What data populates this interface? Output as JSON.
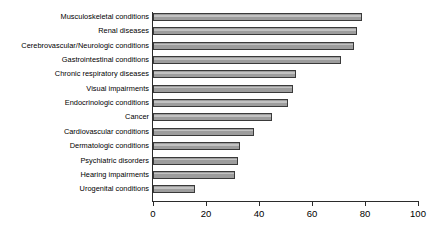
{
  "chart_data": {
    "type": "bar",
    "orientation": "horizontal",
    "title": "",
    "subtitle": "",
    "xlabel": "",
    "ylabel": "",
    "xlim": [
      0,
      100
    ],
    "xticks": [
      0,
      20,
      40,
      60,
      80,
      100
    ],
    "xtick_labels": [
      "0",
      "20",
      "40",
      "60",
      "80",
      "100"
    ],
    "grid": false,
    "legend": null,
    "legend_position": "none",
    "categories": [
      "Musculoskeletal conditions",
      "Renal diseases",
      "Cerebrovascular/Neurologic conditions",
      "Gastrointestinal conditions",
      "Chronic respiratory diseases",
      "Visual impairments",
      "Endocrinologic conditions",
      "Cancer",
      "Cardiovascular conditions",
      "Dermatologic conditions",
      "Psychiatric disorders",
      "Hearing impairments",
      "Urogenital conditions"
    ],
    "values": [
      79,
      77,
      76,
      71,
      54,
      53,
      51,
      45,
      38,
      33,
      32,
      31,
      16
    ],
    "bar_fill_color": "#9d9d9d",
    "bar_edge_color": "#3a3a3a",
    "axis_color": "#2b2b2b",
    "background_color": "#ffffff"
  }
}
